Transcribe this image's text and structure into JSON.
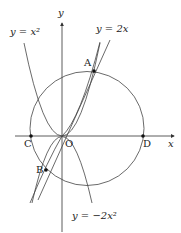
{
  "axes": {
    "x_label": "x",
    "y_label": "y",
    "origin_label": "O"
  },
  "curves": {
    "parabola_up": "y = x²",
    "line": "y = 2x",
    "parabola_down": "y = −2x²"
  },
  "points": {
    "A": "A",
    "B": "B",
    "C": "C",
    "D": "D"
  },
  "colors": {
    "stroke": "#333333",
    "background": "#ffffff"
  }
}
